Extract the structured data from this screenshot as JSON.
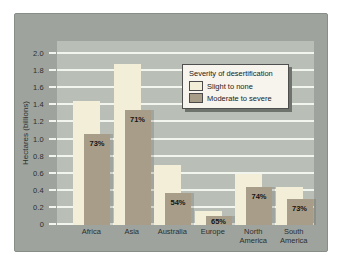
{
  "page": {
    "background": "#ffffff"
  },
  "chart": {
    "background": "#9ea49d",
    "plot_background": "#b9beb7",
    "gridline_color": "#f2f4ee",
    "axis_text_color": "#2e2e2e"
  },
  "chart_data": {
    "type": "bar",
    "style": "overlay",
    "title": "",
    "ylabel": "Hectares (billions)",
    "xlabel": "",
    "ylim": [
      0,
      2.0
    ],
    "ytick_labels": [
      "2.0",
      "1.8",
      "1.6",
      "1.4",
      "1.2",
      "1.0",
      "0.8",
      "0.6",
      "0.4",
      "0.2",
      "0"
    ],
    "grid": "horizontal",
    "categories": [
      "Africa",
      "Asia",
      "Australia",
      "Europe",
      "North America",
      "South America"
    ],
    "series": [
      {
        "name": "Slight to none",
        "color": "#f2eed8",
        "values": [
          1.45,
          1.88,
          0.7,
          0.16,
          0.6,
          0.44
        ]
      },
      {
        "name": "Moderate to severe",
        "color": "#a79d89",
        "values": [
          1.06,
          1.35,
          0.38,
          0.1,
          0.44,
          0.31
        ]
      }
    ],
    "bar_labels": [
      "73%",
      "71%",
      "54%",
      "65%",
      "74%",
      "73%"
    ],
    "legend": {
      "title": "Severity of desertification",
      "position": "upper-right"
    }
  }
}
